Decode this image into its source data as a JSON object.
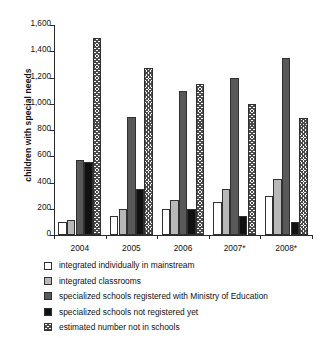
{
  "chart_data": {
    "type": "bar",
    "title": "",
    "xlabel": "",
    "ylabel": "children with special needs",
    "ylim": [
      0,
      1600
    ],
    "ytick_values": [
      0,
      200,
      400,
      600,
      800,
      1000,
      1200,
      1400,
      1600
    ],
    "ytick_labels": [
      "0",
      "200",
      "400",
      "600",
      "800",
      "1,000",
      "1,200",
      "1,400",
      "1,600"
    ],
    "grid": false,
    "legend_position": "below",
    "categories": [
      "2004",
      "2005",
      "2006",
      "2007*",
      "2008*"
    ],
    "series": [
      {
        "name": "integrated individually in mainstream",
        "fill": "open",
        "color": "#ffffff",
        "values": [
          100,
          145,
          200,
          250,
          300
        ]
      },
      {
        "name": "integrated classrooms",
        "fill": "lightgray",
        "color": "#b8b8b8",
        "values": [
          115,
          200,
          270,
          350,
          430
        ]
      },
      {
        "name": "specialized schools registered with Ministry of Education",
        "fill": "darkgray",
        "color": "#595959",
        "values": [
          575,
          900,
          1100,
          1200,
          1350
        ]
      },
      {
        "name": "specialized schools not registered yet",
        "fill": "black",
        "color": "#111111",
        "values": [
          555,
          350,
          200,
          145,
          100
        ]
      },
      {
        "name": "estimated number not in schools",
        "fill": "hatch",
        "color": "#4a4a4a",
        "values": [
          1500,
          1275,
          1150,
          1000,
          895
        ]
      }
    ]
  },
  "legend": {
    "items": [
      {
        "label": "integrated individually in mainstream",
        "fill": "open"
      },
      {
        "label": "integrated classrooms",
        "fill": "lightgray"
      },
      {
        "label": "specialized schools registered with Ministry of Education",
        "fill": "darkgray"
      },
      {
        "label": "specialized schools not registered yet",
        "fill": "black"
      },
      {
        "label": "estimated number not in schools",
        "fill": "hatch"
      }
    ]
  }
}
